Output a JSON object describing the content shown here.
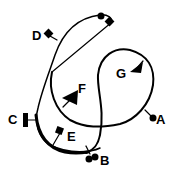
{
  "diagram": {
    "title": "",
    "line_color": "#000000",
    "background": "#ffffff",
    "labels": {
      "A": "A",
      "B": "B",
      "C": "C",
      "D": "D",
      "E": "E",
      "F": "F",
      "G": "G"
    },
    "markers": [
      {
        "id": "A",
        "shape": "circle"
      },
      {
        "id": "B",
        "shape": "double-circle"
      },
      {
        "id": "C",
        "shape": "bar"
      },
      {
        "id": "D",
        "shape": "diamond"
      },
      {
        "id": "E",
        "shape": "diamond"
      },
      {
        "id": "F",
        "shape": "arrowhead"
      },
      {
        "id": "G",
        "shape": "arrowhead"
      }
    ]
  }
}
